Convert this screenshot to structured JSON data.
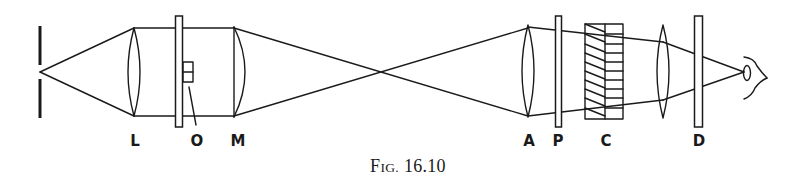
{
  "figure": {
    "caption_prefix_cap": "F",
    "caption_prefix_small": "IG.",
    "caption_number": "16.10",
    "caption_full": "Fig. 16.10",
    "line_color": "#1a1a1a",
    "background": "#ffffff"
  },
  "labels": {
    "L": "L",
    "O": "O",
    "M": "M",
    "A": "A",
    "P": "P",
    "C": "C",
    "D": "D"
  },
  "components": [
    {
      "id": "slit",
      "type": "slit",
      "x": 40
    },
    {
      "id": "L",
      "type": "biconvex-lens",
      "x": 134,
      "label": "L"
    },
    {
      "id": "slide",
      "type": "plate",
      "x": 179
    },
    {
      "id": "O",
      "type": "object",
      "x": 188,
      "label": "O"
    },
    {
      "id": "M",
      "type": "plano-convex-lens",
      "x": 234,
      "label": "M"
    },
    {
      "id": "A",
      "type": "biconvex-lens",
      "x": 528,
      "label": "A"
    },
    {
      "id": "P",
      "type": "plate",
      "x": 558,
      "label": "P"
    },
    {
      "id": "C",
      "type": "compensator",
      "x": 604,
      "label": "C"
    },
    {
      "id": "eyepiece",
      "type": "biconvex-lens",
      "x": 663
    },
    {
      "id": "D",
      "type": "plate",
      "x": 698,
      "label": "D"
    },
    {
      "id": "eye",
      "type": "eye",
      "x": 755
    }
  ]
}
